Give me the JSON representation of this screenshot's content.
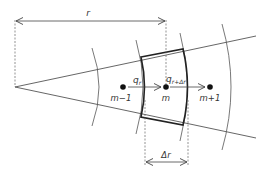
{
  "figure": {
    "colors": {
      "line": "#555555",
      "thick_line": "#222222",
      "node": "#111111",
      "dashed": "#666666"
    }
  },
  "labels": {
    "r": "r",
    "delta_r": "Δr",
    "q_r": "q",
    "q_r_sub": "r",
    "q_r_dr": "q",
    "q_r_dr_sub": "r+Δr"
  },
  "nodes": [
    {
      "id": "m-1",
      "label": "m−1"
    },
    {
      "id": "m",
      "label": "m"
    },
    {
      "id": "m+1",
      "label": "m+1"
    }
  ]
}
